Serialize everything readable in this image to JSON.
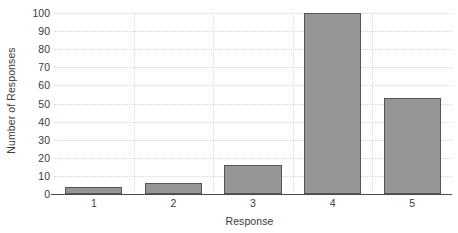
{
  "chart_data": {
    "type": "bar",
    "title": "",
    "subtitle": "",
    "xlabel": "Response",
    "ylabel": "Number of Responses",
    "categories": [
      "1",
      "2",
      "3",
      "4",
      "5"
    ],
    "values": [
      4,
      6,
      16,
      100,
      53
    ],
    "series": [
      {
        "name": "Number of Responses",
        "values": [
          4,
          6,
          16,
          100,
          53
        ]
      }
    ],
    "ylim": [
      0,
      100
    ],
    "y_ticks": [
      0,
      10,
      20,
      30,
      40,
      50,
      60,
      70,
      80,
      90,
      100
    ],
    "y_tick_labels": [
      "0",
      "10",
      "20",
      "30",
      "40",
      "50",
      "60",
      "70",
      "80",
      "90",
      "100"
    ],
    "x_tick_labels": [
      "1",
      "2",
      "3",
      "4",
      "5"
    ],
    "grid": true,
    "grid_style": "dotted",
    "legend": false,
    "legend_position": "none",
    "bar_color": "#969696",
    "bar_edge_color": "#555555",
    "grid_color": "#d8d8d8",
    "axis_color": "#4a4a4a",
    "background_color": "#ffffff",
    "text_color": "#3a3a3a"
  }
}
